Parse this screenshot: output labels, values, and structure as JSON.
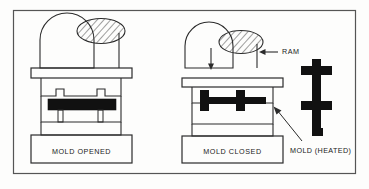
{
  "figure": {
    "background_color": "#fdfdfc",
    "line_color": "#2b2b2b",
    "fill_solid_color": "#111111",
    "border": {
      "present": true,
      "color": "#555555"
    }
  },
  "labels": {
    "mold_opened": "MOLD OPENED",
    "mold_closed": "MOLD CLOSED",
    "ram": "RAM",
    "mold_heated": "MOLD (HEATED)"
  },
  "annotations": {
    "ram_arrow_glyph": "←",
    "ram_arrow_direction": "left",
    "motion_arrow_glyph": "↓",
    "motion_arrow_direction": "down",
    "leader_line_to": "mold_heated"
  },
  "panels": [
    {
      "id": "left",
      "caption": "MOLD OPENED",
      "state": "opened",
      "has_ram_hatched": true,
      "has_motion_arrow": false,
      "part_shape": "flat-slab-with-two-pegs"
    },
    {
      "id": "right",
      "caption": "MOLD CLOSED",
      "state": "closed",
      "has_ram_hatched": true,
      "has_motion_arrow": true,
      "part_shape": "cross-section-beam"
    }
  ],
  "detail_part": {
    "name": "MOLD (HEATED)",
    "orientation": "vertical",
    "shape": "i-beam-cross",
    "fill": "solid-black"
  }
}
